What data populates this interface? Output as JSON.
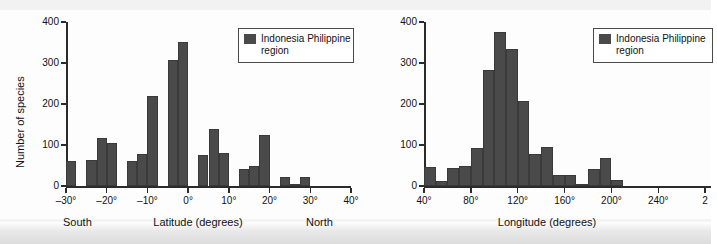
{
  "figure": {
    "background": "#fdfdfd",
    "bar_color": "#4a4a4a",
    "axis_color": "#2b2b2b"
  },
  "chart_data": [
    {
      "type": "bar",
      "title": "",
      "xlabel": "Latitude (degrees)",
      "ylabel": "Number of species",
      "xlim": [
        -30,
        40
      ],
      "ylim": [
        0,
        400
      ],
      "grid": false,
      "legend_position": "top-right",
      "legend_entries": [
        "Indonesia Philippine region"
      ],
      "xticks": [
        -30,
        -20,
        -10,
        0,
        10,
        20,
        30,
        40
      ],
      "xticklabels": [
        "–30°",
        "–20°",
        "–10°",
        "0°",
        "10°",
        "20°",
        "30°",
        "40°"
      ],
      "yticks": [
        0,
        100,
        200,
        300,
        400
      ],
      "yticklabels": [
        "0",
        "100",
        "200",
        "300",
        "400"
      ],
      "axis_annotations": [
        {
          "text": "South",
          "x": -22
        },
        {
          "text": "North",
          "x": 33
        }
      ],
      "bin_width": 2.5,
      "bins": [
        -30,
        -27.5,
        -25,
        -22.5,
        -20,
        -17.5,
        -15,
        -12.5,
        -10,
        -7.5,
        -5,
        -2.5,
        0,
        2.5,
        5,
        7.5,
        10,
        12.5,
        15,
        17.5,
        20,
        22.5,
        25,
        27.5,
        30,
        32.5,
        35,
        37.5
      ],
      "categories": [
        "-30",
        "-27.5",
        "-25",
        "-22.5",
        "-20",
        "-17.5",
        "-15",
        "-12.5",
        "-10",
        "-7.5",
        "-5",
        "-2.5",
        "0",
        "2.5",
        "5",
        "7.5",
        "10",
        "12.5",
        "15",
        "17.5",
        "20",
        "22.5",
        "25",
        "27.5",
        "30",
        "32.5",
        "35",
        "37.5"
      ],
      "values": [
        62,
        0,
        63,
        117,
        105,
        0,
        60,
        77,
        219,
        0,
        308,
        352,
        0,
        76,
        138,
        80,
        0,
        42,
        49,
        125,
        0,
        21,
        4,
        22
      ]
    },
    {
      "type": "bar",
      "title": "",
      "xlabel": "Longitude (degrees)",
      "ylabel": "",
      "xlim": [
        40,
        285
      ],
      "ylim": [
        0,
        400
      ],
      "grid": false,
      "legend_position": "top-right",
      "legend_entries": [
        "Indonesia Philippine region"
      ],
      "xticks": [
        40,
        80,
        120,
        160,
        200,
        240,
        280
      ],
      "xticklabels": [
        "40°",
        "80°",
        "120°",
        "160°",
        "200°",
        "240°",
        "280°"
      ],
      "yticks": [
        0,
        100,
        200,
        300,
        400
      ],
      "yticklabels": [
        "0",
        "100",
        "200",
        "300",
        "400"
      ],
      "bin_width": 10,
      "bins": [
        45,
        60,
        75,
        90,
        105,
        120,
        135,
        150,
        165,
        180,
        195,
        210,
        225,
        240,
        255,
        270
      ],
      "categories": [
        "45",
        "60",
        "75",
        "90",
        "105",
        "120",
        "135",
        "150",
        "165",
        "180",
        "195",
        "210",
        "225",
        "240",
        "255",
        "270"
      ],
      "values": [
        46,
        12,
        45,
        49,
        93,
        282,
        375,
        334,
        208,
        77,
        96,
        28,
        26,
        6,
        42,
        68,
        15
      ]
    }
  ],
  "left_chart": {
    "ylabel": "Number of species",
    "xlabel": "Latitude (degrees)",
    "south_label": "South",
    "north_label": "North",
    "yticklabels": [
      "400",
      "300",
      "200",
      "100",
      "0"
    ],
    "xticklabels": [
      "–30°",
      "–20°",
      "–10°",
      "0°",
      "10°",
      "20°",
      "30°",
      "40°"
    ],
    "legend": {
      "line1": "Indonesia Philippine",
      "line2": "region"
    }
  },
  "right_chart": {
    "xlabel": "Longitude (degrees)",
    "yticklabels": [
      "400",
      "300",
      "200",
      "100",
      "0"
    ],
    "xticklabels": [
      "40°",
      "80°",
      "120°",
      "160°",
      "200°",
      "240°",
      "2"
    ],
    "legend": {
      "line1": "Indonesia Philippine",
      "line2": "region"
    }
  }
}
